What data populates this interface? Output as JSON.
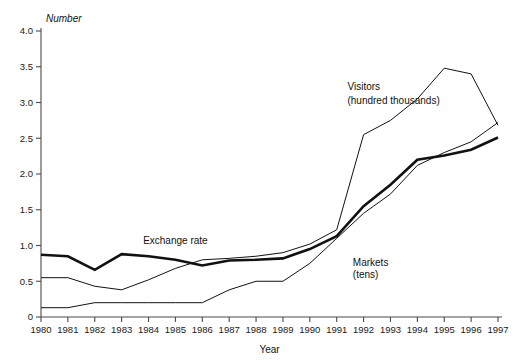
{
  "chart_data": {
    "type": "line",
    "title": "",
    "xlabel": "Year",
    "ylabel": "Number",
    "x": [
      1980,
      1981,
      1982,
      1983,
      1984,
      1985,
      1986,
      1987,
      1988,
      1989,
      1990,
      1991,
      1992,
      1993,
      1994,
      1995,
      1996,
      1997
    ],
    "xtick_labels": [
      "1980",
      "1981",
      "1982",
      "1983",
      "1984",
      "1985",
      "1986",
      "1987",
      "1988",
      "1989",
      "1990",
      "1991",
      "1992",
      "1993",
      "1994",
      "1995",
      "1996",
      "1997"
    ],
    "ytick_labels": [
      "0",
      "0.5",
      "1.0",
      "1.5",
      "2.0",
      "2.5",
      "3.0",
      "3.5",
      "4.0"
    ],
    "ytick_values": [
      0,
      0.5,
      1.0,
      1.5,
      2.0,
      2.5,
      3.0,
      3.5,
      4.0
    ],
    "ylim": [
      0,
      4.0
    ],
    "xlim": [
      1980,
      1997
    ],
    "grid": false,
    "legend_position": "inline-annotations",
    "series": [
      {
        "name": "Exchange rate",
        "style": "thick",
        "values": [
          0.87,
          0.85,
          0.66,
          0.88,
          0.85,
          0.8,
          0.72,
          0.79,
          0.8,
          0.82,
          0.95,
          1.13,
          1.55,
          1.85,
          2.2,
          2.26,
          2.34,
          2.51
        ]
      },
      {
        "name": "Visitors (hundred thousands)",
        "style": "thin",
        "values": [
          0.55,
          0.55,
          0.43,
          0.38,
          0.52,
          0.68,
          0.8,
          0.82,
          0.85,
          0.9,
          1.02,
          1.22,
          2.55,
          2.75,
          3.05,
          3.48,
          3.4,
          2.68
        ]
      },
      {
        "name": "Markets (tens)",
        "style": "thin",
        "values": [
          0.13,
          0.13,
          0.2,
          0.2,
          0.2,
          0.2,
          0.2,
          0.38,
          0.5,
          0.5,
          0.75,
          1.1,
          1.45,
          1.72,
          2.12,
          2.3,
          2.45,
          2.72
        ]
      }
    ],
    "annotations": [
      {
        "name": "exchange-rate-label",
        "text": "Exchange rate",
        "x": 1983.8,
        "y": 1.02
      },
      {
        "name": "visitors-label-line1",
        "text": "Visitors",
        "x": 1991.4,
        "y": 3.18
      },
      {
        "name": "visitors-label-line2",
        "text": "(hundred thousands)",
        "x": 1991.4,
        "y": 2.98
      },
      {
        "name": "markets-label-line1",
        "text": "Markets",
        "x": 1991.6,
        "y": 0.72
      },
      {
        "name": "markets-label-line2",
        "text": "(tens)",
        "x": 1991.6,
        "y": 0.54
      }
    ],
    "colors": {
      "line": "#111111",
      "axis": "#4a4a4a",
      "background": "#ffffff",
      "text": "#111111"
    }
  }
}
